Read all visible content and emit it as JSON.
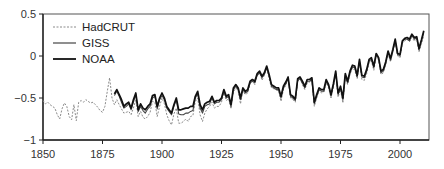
{
  "chart_data": {
    "type": "line",
    "title": "",
    "xlabel": "",
    "ylabel": "",
    "xlim": [
      1850,
      2012
    ],
    "ylim": [
      -1,
      0.5
    ],
    "grid": false,
    "legend_position": "upper left",
    "x_ticks": [
      1850,
      1875,
      1900,
      1925,
      1950,
      1975,
      2000
    ],
    "y_ticks": [
      0.5,
      0,
      -0.5,
      -1
    ],
    "y_tick_labels": [
      "0.5",
      "0",
      "-0.5",
      "-1"
    ],
    "legend": [
      "HadCRUT",
      "GISS",
      "NOAA"
    ],
    "series": [
      {
        "name": "HadCRUT",
        "style": "dashed",
        "color": "#8a8a8a",
        "x": [
          1850,
          1851,
          1852,
          1853,
          1854,
          1855,
          1856,
          1857,
          1858,
          1859,
          1860,
          1861,
          1862,
          1863,
          1864,
          1865,
          1866,
          1867,
          1868,
          1869,
          1870,
          1871,
          1872,
          1873,
          1874,
          1875,
          1876,
          1877,
          1878,
          1879,
          1880,
          1881,
          1882,
          1883,
          1884,
          1885,
          1886,
          1887,
          1888,
          1889,
          1890,
          1891,
          1892,
          1893,
          1894,
          1895,
          1896,
          1897,
          1898,
          1899,
          1900,
          1901,
          1902,
          1903,
          1904,
          1905,
          1906,
          1907,
          1908,
          1909,
          1910,
          1911,
          1912,
          1913,
          1914,
          1915,
          1916,
          1917,
          1918,
          1919,
          1920,
          1921,
          1922,
          1923,
          1924,
          1925,
          1926,
          1927,
          1928,
          1929,
          1930,
          1931,
          1932,
          1933,
          1934,
          1935,
          1936,
          1937,
          1938,
          1939,
          1940,
          1941,
          1942,
          1943,
          1944,
          1945,
          1946,
          1947,
          1948,
          1949,
          1950,
          1951,
          1952,
          1953,
          1954,
          1955,
          1956,
          1957,
          1958,
          1959,
          1960,
          1961,
          1962,
          1963,
          1964,
          1965,
          1966,
          1967,
          1968,
          1969,
          1970,
          1971,
          1972,
          1973,
          1974,
          1975,
          1976,
          1977,
          1978,
          1979,
          1980,
          1981,
          1982,
          1983,
          1984,
          1985,
          1986,
          1987,
          1988,
          1989,
          1990,
          1991,
          1992,
          1993,
          1994,
          1995,
          1996,
          1997,
          1998,
          1999,
          2000,
          2001,
          2002,
          2003,
          2004,
          2005,
          2006,
          2007,
          2008,
          2009,
          2010
        ],
        "values": [
          -0.53,
          -0.57,
          -0.55,
          -0.58,
          -0.6,
          -0.62,
          -0.7,
          -0.75,
          -0.63,
          -0.56,
          -0.6,
          -0.72,
          -0.76,
          -0.58,
          -0.77,
          -0.55,
          -0.53,
          -0.55,
          -0.52,
          -0.54,
          -0.56,
          -0.55,
          -0.58,
          -0.61,
          -0.65,
          -0.67,
          -0.6,
          -0.42,
          -0.26,
          -0.5,
          -0.58,
          -0.52,
          -0.58,
          -0.63,
          -0.68,
          -0.67,
          -0.66,
          -0.7,
          -0.62,
          -0.52,
          -0.72,
          -0.66,
          -0.73,
          -0.75,
          -0.72,
          -0.67,
          -0.54,
          -0.55,
          -0.72,
          -0.6,
          -0.5,
          -0.57,
          -0.7,
          -0.77,
          -0.82,
          -0.69,
          -0.62,
          -0.8,
          -0.8,
          -0.78,
          -0.75,
          -0.78,
          -0.72,
          -0.71,
          -0.54,
          -0.5,
          -0.7,
          -0.78,
          -0.68,
          -0.63,
          -0.6,
          -0.55,
          -0.62,
          -0.6,
          -0.6,
          -0.55,
          -0.44,
          -0.53,
          -0.51,
          -0.63,
          -0.43,
          -0.38,
          -0.42,
          -0.57,
          -0.42,
          -0.46,
          -0.44,
          -0.33,
          -0.3,
          -0.34,
          -0.22,
          -0.19,
          -0.29,
          -0.23,
          -0.14,
          -0.27,
          -0.38,
          -0.39,
          -0.4,
          -0.42,
          -0.54,
          -0.4,
          -0.35,
          -0.27,
          -0.5,
          -0.52,
          -0.55,
          -0.3,
          -0.27,
          -0.34,
          -0.4,
          -0.32,
          -0.31,
          -0.29,
          -0.6,
          -0.5,
          -0.41,
          -0.44,
          -0.43,
          -0.32,
          -0.38,
          -0.5,
          -0.37,
          -0.22,
          -0.49,
          -0.4,
          -0.56,
          -0.25,
          -0.34,
          -0.22,
          -0.14,
          -0.17,
          -0.27,
          -0.08,
          -0.28,
          -0.29,
          -0.21,
          -0.08,
          -0.06,
          -0.17,
          0.0,
          -0.05,
          -0.22,
          -0.2,
          -0.1,
          0.03,
          -0.07,
          0.05,
          0.18,
          0.0,
          -0.02,
          0.15,
          0.18,
          0.2,
          0.17,
          0.22,
          0.18,
          0.2,
          0.05,
          0.14,
          0.24
        ]
      },
      {
        "name": "GISS",
        "style": "solid-thin",
        "color": "#444444",
        "x": [
          1880,
          1881,
          1882,
          1883,
          1884,
          1885,
          1886,
          1887,
          1888,
          1889,
          1890,
          1891,
          1892,
          1893,
          1894,
          1895,
          1896,
          1897,
          1898,
          1899,
          1900,
          1901,
          1902,
          1903,
          1904,
          1905,
          1906,
          1907,
          1908,
          1909,
          1910,
          1911,
          1912,
          1913,
          1914,
          1915,
          1916,
          1917,
          1918,
          1919,
          1920,
          1921,
          1922,
          1923,
          1924,
          1925,
          1926,
          1927,
          1928,
          1929,
          1930,
          1931,
          1932,
          1933,
          1934,
          1935,
          1936,
          1937,
          1938,
          1939,
          1940,
          1941,
          1942,
          1943,
          1944,
          1945,
          1946,
          1947,
          1948,
          1949,
          1950,
          1951,
          1952,
          1953,
          1954,
          1955,
          1956,
          1957,
          1958,
          1959,
          1960,
          1961,
          1962,
          1963,
          1964,
          1965,
          1966,
          1967,
          1968,
          1969,
          1970,
          1971,
          1972,
          1973,
          1974,
          1975,
          1976,
          1977,
          1978,
          1979,
          1980,
          1981,
          1982,
          1983,
          1984,
          1985,
          1986,
          1987,
          1988,
          1989,
          1990,
          1991,
          1992,
          1993,
          1994,
          1995,
          1996,
          1997,
          1998,
          1999,
          2000,
          2001,
          2002,
          2003,
          2004,
          2005,
          2006,
          2007,
          2008,
          2009,
          2010
        ],
        "values": [
          -0.47,
          -0.42,
          -0.48,
          -0.55,
          -0.62,
          -0.6,
          -0.57,
          -0.64,
          -0.55,
          -0.46,
          -0.66,
          -0.6,
          -0.65,
          -0.68,
          -0.63,
          -0.6,
          -0.5,
          -0.48,
          -0.63,
          -0.52,
          -0.47,
          -0.52,
          -0.62,
          -0.66,
          -0.7,
          -0.6,
          -0.52,
          -0.69,
          -0.7,
          -0.7,
          -0.68,
          -0.68,
          -0.66,
          -0.65,
          -0.5,
          -0.45,
          -0.62,
          -0.68,
          -0.6,
          -0.58,
          -0.57,
          -0.5,
          -0.57,
          -0.55,
          -0.55,
          -0.52,
          -0.42,
          -0.5,
          -0.48,
          -0.6,
          -0.4,
          -0.36,
          -0.4,
          -0.52,
          -0.4,
          -0.44,
          -0.42,
          -0.32,
          -0.3,
          -0.32,
          -0.23,
          -0.2,
          -0.26,
          -0.22,
          -0.14,
          -0.24,
          -0.36,
          -0.38,
          -0.4,
          -0.4,
          -0.5,
          -0.38,
          -0.33,
          -0.27,
          -0.48,
          -0.5,
          -0.53,
          -0.29,
          -0.27,
          -0.32,
          -0.38,
          -0.3,
          -0.3,
          -0.28,
          -0.57,
          -0.48,
          -0.4,
          -0.42,
          -0.42,
          -0.3,
          -0.36,
          -0.48,
          -0.35,
          -0.2,
          -0.46,
          -0.38,
          -0.52,
          -0.23,
          -0.32,
          -0.2,
          -0.13,
          -0.14,
          -0.25,
          -0.06,
          -0.25,
          -0.26,
          -0.18,
          -0.06,
          -0.04,
          -0.14,
          0.02,
          -0.03,
          -0.2,
          -0.18,
          -0.09,
          0.05,
          -0.05,
          0.06,
          0.18,
          0.02,
          0.0,
          0.17,
          0.2,
          0.2,
          0.18,
          0.25,
          0.2,
          0.22,
          0.07,
          0.18,
          0.28
        ]
      },
      {
        "name": "NOAA",
        "style": "solid-thick",
        "color": "#111111",
        "x": [
          1880,
          1881,
          1882,
          1883,
          1884,
          1885,
          1886,
          1887,
          1888,
          1889,
          1890,
          1891,
          1892,
          1893,
          1894,
          1895,
          1896,
          1897,
          1898,
          1899,
          1900,
          1901,
          1902,
          1903,
          1904,
          1905,
          1906,
          1907,
          1908,
          1909,
          1910,
          1911,
          1912,
          1913,
          1914,
          1915,
          1916,
          1917,
          1918,
          1919,
          1920,
          1921,
          1922,
          1923,
          1924,
          1925,
          1926,
          1927,
          1928,
          1929,
          1930,
          1931,
          1932,
          1933,
          1934,
          1935,
          1936,
          1937,
          1938,
          1939,
          1940,
          1941,
          1942,
          1943,
          1944,
          1945,
          1946,
          1947,
          1948,
          1949,
          1950,
          1951,
          1952,
          1953,
          1954,
          1955,
          1956,
          1957,
          1958,
          1959,
          1960,
          1961,
          1962,
          1963,
          1964,
          1965,
          1966,
          1967,
          1968,
          1969,
          1970,
          1971,
          1972,
          1973,
          1974,
          1975,
          1976,
          1977,
          1978,
          1979,
          1980,
          1981,
          1982,
          1983,
          1984,
          1985,
          1986,
          1987,
          1988,
          1989,
          1990,
          1991,
          1992,
          1993,
          1994,
          1995,
          1996,
          1997,
          1998,
          1999,
          2000,
          2001,
          2002,
          2003,
          2004,
          2005,
          2006,
          2007,
          2008,
          2009,
          2010
        ],
        "values": [
          -0.45,
          -0.4,
          -0.46,
          -0.52,
          -0.6,
          -0.57,
          -0.55,
          -0.62,
          -0.52,
          -0.44,
          -0.64,
          -0.57,
          -0.62,
          -0.64,
          -0.6,
          -0.57,
          -0.47,
          -0.46,
          -0.6,
          -0.5,
          -0.44,
          -0.5,
          -0.6,
          -0.64,
          -0.68,
          -0.58,
          -0.5,
          -0.64,
          -0.64,
          -0.63,
          -0.62,
          -0.62,
          -0.6,
          -0.6,
          -0.48,
          -0.42,
          -0.58,
          -0.64,
          -0.57,
          -0.55,
          -0.54,
          -0.48,
          -0.55,
          -0.53,
          -0.53,
          -0.5,
          -0.4,
          -0.48,
          -0.46,
          -0.58,
          -0.38,
          -0.34,
          -0.38,
          -0.5,
          -0.38,
          -0.42,
          -0.4,
          -0.3,
          -0.28,
          -0.3,
          -0.21,
          -0.18,
          -0.24,
          -0.2,
          -0.12,
          -0.22,
          -0.34,
          -0.36,
          -0.38,
          -0.38,
          -0.48,
          -0.36,
          -0.31,
          -0.25,
          -0.46,
          -0.48,
          -0.51,
          -0.27,
          -0.25,
          -0.3,
          -0.36,
          -0.28,
          -0.28,
          -0.26,
          -0.55,
          -0.46,
          -0.38,
          -0.4,
          -0.4,
          -0.28,
          -0.34,
          -0.46,
          -0.33,
          -0.18,
          -0.44,
          -0.36,
          -0.5,
          -0.21,
          -0.3,
          -0.18,
          -0.11,
          -0.12,
          -0.23,
          -0.04,
          -0.23,
          -0.24,
          -0.16,
          -0.04,
          -0.02,
          -0.12,
          0.03,
          -0.02,
          -0.18,
          -0.16,
          -0.07,
          0.06,
          -0.03,
          0.08,
          0.2,
          0.03,
          0.02,
          0.18,
          0.21,
          0.22,
          0.2,
          0.26,
          0.22,
          0.23,
          0.09,
          0.19,
          0.3
        ]
      }
    ]
  },
  "legend": {
    "items": [
      {
        "label": "HadCRUT"
      },
      {
        "label": "GISS"
      },
      {
        "label": "NOAA"
      }
    ]
  },
  "axes": {
    "x_tick_labels": [
      "1850",
      "1875",
      "1900",
      "1925",
      "1950",
      "1975",
      "2000"
    ],
    "y_tick_labels": [
      "0.5",
      "0",
      "-0.5",
      "-1"
    ]
  }
}
